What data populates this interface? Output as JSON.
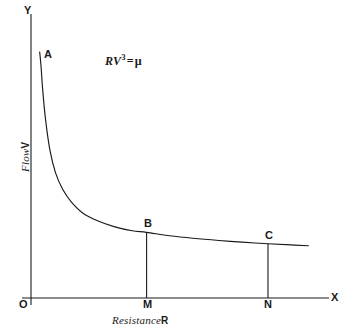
{
  "figure": {
    "background_color": "#ffffff",
    "ink_color": "#1a1a1a",
    "equation": {
      "base": "RV",
      "exponent": "3",
      "equals": "=",
      "constant": "μ",
      "full_text": "RV³ = μ"
    },
    "axis_labels": {
      "y_axis_end": "Y",
      "x_axis_end": "X",
      "origin": "O",
      "y_title": "Flow",
      "y_title_var": "V",
      "x_title": "Resistance",
      "x_title_var": "R"
    },
    "point_labels": {
      "a": "A",
      "b": "B",
      "c": "C",
      "m": "M",
      "n": "N"
    }
  },
  "chart_data": {
    "type": "line",
    "title": "",
    "subtitle": "",
    "annotations": [
      "RV³ = μ",
      "A",
      "B",
      "C",
      "M",
      "N",
      "O",
      "X",
      "Y"
    ],
    "xlabel": "Resistance R",
    "ylabel": "Flow V",
    "xlim": [
      0,
      10
    ],
    "ylim": [
      0,
      10
    ],
    "grid": false,
    "legend": false,
    "xticks": [
      "O",
      "M",
      "N",
      "X"
    ],
    "xtick_values": [
      0,
      4.0,
      8.2
    ],
    "yticks": [],
    "curve": {
      "name": "RV³ = μ",
      "relation": "R * V^3 = mu",
      "description": "Decreasing hyperbolic curve: flow V falls as resistance R rises",
      "x": [
        0.3,
        0.35,
        0.4,
        0.5,
        0.65,
        0.85,
        1.1,
        1.4,
        1.8,
        2.3,
        2.9,
        3.5,
        4.0,
        4.8,
        5.6,
        6.5,
        7.3,
        8.2,
        9.0,
        9.6
      ],
      "y": [
        8.85,
        8.3,
        7.55,
        6.45,
        5.35,
        4.5,
        3.9,
        3.45,
        3.05,
        2.78,
        2.56,
        2.42,
        2.36,
        2.24,
        2.15,
        2.07,
        2.01,
        1.95,
        1.91,
        1.88
      ]
    },
    "points": [
      {
        "label": "A",
        "x": 0.3,
        "y": 8.85,
        "note": "upper end of curve near Y axis"
      },
      {
        "label": "B",
        "x": 4.0,
        "y": 2.36,
        "note": "ordinate BM drops to M on X axis"
      },
      {
        "label": "C",
        "x": 8.2,
        "y": 1.95,
        "note": "ordinate CN drops to N on X axis"
      }
    ],
    "ordinates": [
      {
        "from": "B",
        "to": "M",
        "x": 4.0,
        "y_top": 2.36,
        "y_bottom": 0
      },
      {
        "from": "C",
        "to": "N",
        "x": 8.2,
        "y_top": 1.95,
        "y_bottom": 0
      }
    ]
  }
}
